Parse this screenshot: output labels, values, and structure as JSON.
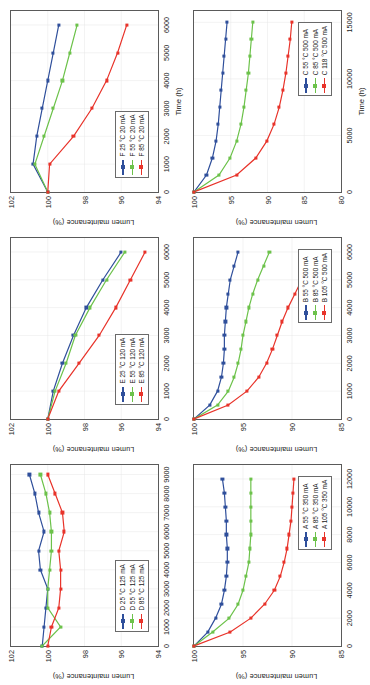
{
  "figure": {
    "xlabel": "Time (h)",
    "ylabel": "Lumen maintenance (%)",
    "colors": {
      "blue": "#2F4F9B",
      "green": "#6CC24A",
      "red": "#E8332A",
      "axis": "#5a5a5a",
      "grid": "#e6e6e6"
    }
  },
  "chart_data": [
    {
      "id": "panel-a",
      "type": "line",
      "title": "",
      "xlabel": "",
      "ylabel": "Lumen maintenance (%)",
      "xlim": [
        0,
        13000
      ],
      "ylim": [
        85,
        100
      ],
      "xticks": [
        0,
        2000,
        4000,
        6000,
        8000,
        10000,
        12000
      ],
      "yticks": [
        85,
        90,
        95,
        100
      ],
      "grid": true,
      "legend_position": "bottom-right",
      "series": [
        {
          "name": "A 55 °C 350 mA",
          "color": "#2F4F9B",
          "x": [
            0,
            1000,
            2000,
            3000,
            4000,
            5000,
            6000,
            7000,
            8000,
            9000,
            10000,
            11000,
            12000
          ],
          "y": [
            100,
            98.6,
            97.8,
            97.2,
            96.9,
            96.7,
            96.6,
            96.6,
            96.7,
            96.7,
            96.8,
            96.9,
            97.1
          ]
        },
        {
          "name": "A 85 °C 350 mA",
          "color": "#6CC24A",
          "x": [
            0,
            1000,
            2000,
            3000,
            4000,
            5000,
            6000,
            7000,
            8000,
            9000,
            10000,
            11000,
            12000
          ],
          "y": [
            100,
            98.1,
            96.4,
            95.5,
            95.0,
            94.7,
            94.4,
            94.3,
            94.2,
            94.2,
            94.2,
            94.2,
            94.2
          ]
        },
        {
          "name": "A 105 °C 350 mA",
          "color": "#E8332A",
          "x": [
            0,
            1000,
            2000,
            3000,
            4000,
            5000,
            6000,
            7000,
            8000,
            9000,
            10000,
            11000,
            12000
          ],
          "y": [
            100,
            96.3,
            94.2,
            92.8,
            91.8,
            91.2,
            90.8,
            90.5,
            90.3,
            90.1,
            90.0,
            89.9,
            89.8
          ]
        }
      ]
    },
    {
      "id": "panel-b",
      "type": "line",
      "title": "",
      "xlabel": "",
      "ylabel": "Lumen maintenance (%)",
      "xlim": [
        0,
        6500
      ],
      "ylim": [
        85,
        100
      ],
      "xticks": [
        0,
        1000,
        2000,
        3000,
        4000,
        5000,
        6000
      ],
      "yticks": [
        85,
        90,
        95,
        100
      ],
      "grid": true,
      "legend_position": "bottom-right",
      "series": [
        {
          "name": "B 55 °C 500 mA",
          "color": "#2F4F9B",
          "x": [
            0,
            500,
            1000,
            1500,
            2000,
            2500,
            3000,
            3500,
            4000,
            4500,
            5000,
            5500,
            6000
          ],
          "y": [
            100,
            98.4,
            97.6,
            97.2,
            97.0,
            96.9,
            96.9,
            96.8,
            96.7,
            96.5,
            96.3,
            95.9,
            95.5
          ]
        },
        {
          "name": "B 85 °C 500 mA",
          "color": "#6CC24A",
          "x": [
            0,
            500,
            1000,
            1500,
            2000,
            2500,
            3000,
            3500,
            4000,
            4500,
            5000,
            5500,
            6000
          ],
          "y": [
            100,
            97.6,
            96.5,
            95.9,
            95.5,
            95.2,
            95.0,
            94.7,
            94.4,
            94.0,
            93.5,
            92.9,
            92.3
          ]
        },
        {
          "name": "B 105 °C 500 mA",
          "color": "#E8332A",
          "x": [
            0,
            500,
            1000,
            1500,
            2000,
            2500,
            3000,
            3500,
            4000,
            4500,
            5000,
            5500,
            6000
          ],
          "y": [
            100,
            96.5,
            94.6,
            93.4,
            92.6,
            92.0,
            91.5,
            91.0,
            90.4,
            89.7,
            89.0,
            88.2,
            87.4
          ]
        }
      ]
    },
    {
      "id": "panel-c",
      "type": "line",
      "title": "",
      "xlabel": "Time (h)",
      "ylabel": "Lumen maintenance (%)",
      "xlim": [
        0,
        16000
      ],
      "ylim": [
        80,
        100
      ],
      "xticks": [
        0,
        5000,
        10000,
        15000
      ],
      "yticks": [
        80,
        85,
        90,
        95,
        100
      ],
      "grid": true,
      "legend_position": "bottom-right",
      "series": [
        {
          "name": "C 55 °C 500 mA",
          "color": "#2F4F9B",
          "x": [
            0,
            1500,
            3000,
            4500,
            6000,
            7500,
            9000,
            10500,
            12000,
            13500,
            15000
          ],
          "y": [
            100,
            98.3,
            97.5,
            97.0,
            96.7,
            96.5,
            96.3,
            96.1,
            95.9,
            95.7,
            95.5
          ]
        },
        {
          "name": "C 85 °C 500 mA",
          "color": "#6CC24A",
          "x": [
            0,
            1500,
            3000,
            4500,
            6000,
            7500,
            9000,
            10500,
            12000,
            13500,
            15000
          ],
          "y": [
            100,
            96.6,
            95.1,
            94.2,
            93.6,
            93.2,
            92.9,
            92.6,
            92.4,
            92.2,
            92.0
          ]
        },
        {
          "name": "C 118 °C 500 mA",
          "color": "#E8332A",
          "x": [
            0,
            1500,
            3000,
            4500,
            6000,
            7500,
            9000,
            10500,
            12000,
            13500,
            15000
          ],
          "y": [
            100,
            94.2,
            91.6,
            90.1,
            89.1,
            88.4,
            87.9,
            87.5,
            87.2,
            86.9,
            86.7
          ]
        }
      ]
    },
    {
      "id": "panel-d",
      "type": "line",
      "title": "",
      "xlabel": "",
      "ylabel": "Lumen maintenance (%)",
      "xlim": [
        0,
        9500
      ],
      "ylim": [
        94,
        102
      ],
      "xticks": [
        0,
        1000,
        2000,
        3000,
        4000,
        5000,
        6000,
        7000,
        8000,
        9000
      ],
      "yticks": [
        94,
        96,
        98,
        100,
        102
      ],
      "grid": true,
      "legend_position": "bottom-left",
      "series": [
        {
          "name": "D 25 °C 125 mA",
          "color": "#2F4F9B",
          "x": [
            0,
            1000,
            2000,
            3000,
            4000,
            5000,
            6000,
            7000,
            8000,
            9000
          ],
          "y": [
            100.3,
            100.2,
            100.1,
            100.0,
            100.4,
            100.5,
            100.2,
            100.5,
            100.7,
            101.0
          ]
        },
        {
          "name": "D 55 °C 125 mA",
          "color": "#6CC24A",
          "x": [
            0,
            1000,
            2000,
            3000,
            4000,
            5000,
            6000,
            7000,
            8000,
            9000
          ],
          "y": [
            100.3,
            99.3,
            100.0,
            100.0,
            99.9,
            99.8,
            99.8,
            99.9,
            100.1,
            100.4
          ]
        },
        {
          "name": "D 85 °C 125 mA",
          "color": "#E8332A",
          "x": [
            0,
            1000,
            2000,
            3000,
            4000,
            5000,
            6000,
            7000,
            8000,
            9000
          ],
          "y": [
            100.0,
            99.8,
            99.4,
            99.3,
            99.3,
            99.4,
            99.1,
            99.2,
            99.6,
            100.0
          ]
        }
      ]
    },
    {
      "id": "panel-e",
      "type": "line",
      "title": "",
      "xlabel": "",
      "ylabel": "Lumen maintenance (%)",
      "xlim": [
        0,
        6500
      ],
      "ylim": [
        94,
        102
      ],
      "xticks": [
        0,
        1000,
        2000,
        3000,
        4000,
        5000,
        6000
      ],
      "yticks": [
        94,
        96,
        98,
        100,
        102
      ],
      "grid": true,
      "legend_position": "bottom-left",
      "series": [
        {
          "name": "E 25 °C 120 mA",
          "color": "#2F4F9B",
          "x": [
            0,
            1000,
            2000,
            3000,
            4000,
            5000,
            6000
          ],
          "y": [
            100.0,
            99.7,
            99.2,
            98.6,
            97.9,
            97.0,
            96.0
          ]
        },
        {
          "name": "E 55 °C 120 mA",
          "color": "#6CC24A",
          "x": [
            0,
            1000,
            2000,
            3000,
            4000,
            5000,
            6000
          ],
          "y": [
            100.0,
            99.6,
            99.0,
            98.5,
            97.7,
            96.8,
            95.8
          ]
        },
        {
          "name": "E 85 °C 120 mA",
          "color": "#E8332A",
          "x": [
            0,
            1000,
            2000,
            3000,
            4000,
            5000,
            6000
          ],
          "y": [
            100.0,
            99.4,
            98.3,
            97.2,
            96.3,
            95.5,
            94.7
          ]
        }
      ]
    },
    {
      "id": "panel-f",
      "type": "line",
      "title": "",
      "xlabel": "Time (h)",
      "ylabel": "Lumen maintenance (%)",
      "xlim": [
        0,
        6500
      ],
      "ylim": [
        94,
        102
      ],
      "xticks": [
        0,
        1000,
        2000,
        3000,
        4000,
        5000,
        6000
      ],
      "yticks": [
        94,
        96,
        98,
        100,
        102
      ],
      "grid": true,
      "legend_position": "bottom-left",
      "series": [
        {
          "name": "F 25 °C 20 mA",
          "color": "#2F4F9B",
          "x": [
            0,
            1000,
            2000,
            3000,
            4000,
            5000,
            6000
          ],
          "y": [
            100.0,
            100.8,
            100.6,
            100.3,
            100.0,
            99.7,
            99.4
          ]
        },
        {
          "name": "F 55 °C 20 mA",
          "color": "#6CC24A",
          "x": [
            0,
            1000,
            2000,
            3000,
            4000,
            5000,
            6000
          ],
          "y": [
            100.0,
            100.7,
            100.2,
            99.7,
            99.2,
            98.8,
            98.4
          ]
        },
        {
          "name": "F 85 °C 20 mA",
          "color": "#E8332A",
          "x": [
            0,
            1000,
            2000,
            3000,
            4000,
            5000,
            6000
          ],
          "y": [
            100.0,
            99.9,
            98.6,
            97.6,
            96.8,
            96.2,
            95.7
          ]
        }
      ]
    }
  ]
}
